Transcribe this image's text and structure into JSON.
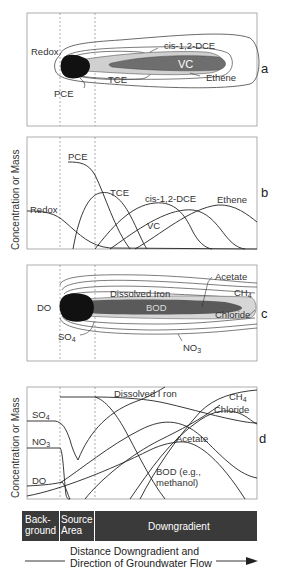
{
  "figure": {
    "shared": {
      "y_axis_label": "Concentration or Mass",
      "dashed_boundaries": [
        "background/source",
        "source/downgradient"
      ]
    },
    "panel_a": {
      "letter": "a",
      "labels": {
        "redox": "Redox",
        "pce": "PCE",
        "tce": "TCE",
        "dce": "cis-1,2-DCE",
        "vc": "VC",
        "ethene": "Ethene"
      }
    },
    "panel_b": {
      "letter": "b",
      "labels": {
        "pce": "PCE",
        "tce": "TCE",
        "dce": "cis-1,2-DCE",
        "vc": "VC",
        "ethene": "Ethene",
        "redox": "Redox"
      }
    },
    "panel_c": {
      "letter": "c",
      "labels": {
        "do": "DO",
        "acetate": "Acetate",
        "iron": "Dissolved  Iron",
        "ch4": "CH",
        "ch4_sub": "4",
        "bod": "BOD",
        "chloride": "Chloride",
        "so4": "SO",
        "so4_sub": "4",
        "no3": "NO",
        "no3_sub": "3"
      }
    },
    "panel_d": {
      "letter": "d",
      "labels": {
        "iron": "Dissolved I ron",
        "ch4": "CH",
        "ch4_sub": "4",
        "chloride": "Chloride",
        "so4": "SO",
        "so4_sub": "4",
        "no3": "NO",
        "no3_sub": "3",
        "acetate": "Acetate",
        "do": "DO",
        "bod_line1": "BOD (e.g.,",
        "bod_line2": "methanol)"
      }
    },
    "zones": {
      "background_line1": "Back-",
      "background_line2": "ground",
      "source_line1": "Source",
      "source_line2": "Area",
      "downgradient": "Downgradient"
    },
    "x_axis": {
      "line1": "Distance Downgradient and",
      "line2": "Direction of Groundwater Flow"
    },
    "colors": {
      "source_blob": "#111111",
      "vc_plume": "#6e6e6e",
      "dce_plume": "#d0d0d0",
      "bod_plume": "#5a5a5a",
      "chloride_plume": "#d6d6d6",
      "zone_bar": "#3a3a3a",
      "line": "#222222",
      "frame": "#999999"
    }
  }
}
